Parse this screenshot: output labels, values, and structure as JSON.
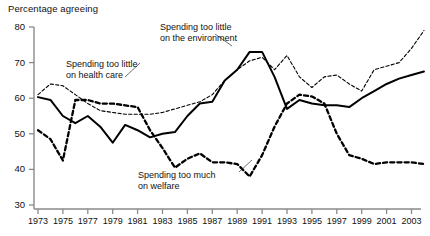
{
  "chart_data": {
    "type": "line",
    "title": "Percentage agreeing",
    "xlabel": "",
    "ylabel": "Percentage agreeing",
    "ylim": [
      30,
      80
    ],
    "xlim": [
      1972,
      2004.5
    ],
    "yticks": [
      30,
      40,
      50,
      60,
      70,
      80
    ],
    "xticks": [
      1973,
      1975,
      1977,
      1979,
      1981,
      1983,
      1985,
      1987,
      1989,
      1991,
      1993,
      1995,
      1997,
      1999,
      2001,
      2003
    ],
    "grid": false,
    "legend_position": "inline-annotations",
    "series": [
      {
        "name": "Spending too little on the environment",
        "style": "solid",
        "color": "#000000",
        "points": [
          [
            1973,
            60.3
          ],
          [
            1974,
            59.5
          ],
          [
            1975,
            55.0
          ],
          [
            1976,
            53.0
          ],
          [
            1977,
            55.0
          ],
          [
            1978,
            52.0
          ],
          [
            1979,
            47.5
          ],
          [
            1980,
            52.5
          ],
          [
            1981,
            51.0
          ],
          [
            1982,
            49.0
          ],
          [
            1983,
            50.0
          ],
          [
            1984,
            50.5
          ],
          [
            1985,
            55.0
          ],
          [
            1986,
            58.5
          ],
          [
            1987,
            59.0
          ],
          [
            1988,
            65.0
          ],
          [
            1989,
            68.0
          ],
          [
            1990,
            73.0
          ],
          [
            1991,
            73.0
          ],
          [
            1992,
            66.0
          ],
          [
            1993,
            57.0
          ],
          [
            1994,
            59.5
          ],
          [
            1995,
            58.5
          ],
          [
            1996,
            58.0
          ],
          [
            1997,
            58.0
          ],
          [
            1998,
            57.5
          ],
          [
            1999,
            60.0
          ],
          [
            2000,
            62.0
          ],
          [
            2001,
            64.0
          ],
          [
            2002,
            65.5
          ],
          [
            2003,
            66.5
          ],
          [
            2004,
            67.5
          ]
        ]
      },
      {
        "name": "Spending too little on health care",
        "style": "fine-dashed",
        "color": "#000000",
        "points": [
          [
            1973,
            61.0
          ],
          [
            1974,
            64.0
          ],
          [
            1975,
            63.5
          ],
          [
            1976,
            61.0
          ],
          [
            1977,
            58.5
          ],
          [
            1978,
            56.5
          ],
          [
            1979,
            56.0
          ],
          [
            1980,
            55.5
          ],
          [
            1981,
            55.5
          ],
          [
            1982,
            55.5
          ],
          [
            1983,
            56.0
          ],
          [
            1984,
            57.0
          ],
          [
            1985,
            58.0
          ],
          [
            1986,
            59.0
          ],
          [
            1987,
            61.0
          ],
          [
            1988,
            65.0
          ],
          [
            1989,
            68.0
          ],
          [
            1990,
            70.5
          ],
          [
            1991,
            71.5
          ],
          [
            1992,
            68.0
          ],
          [
            1993,
            72.0
          ],
          [
            1994,
            66.0
          ],
          [
            1995,
            63.0
          ],
          [
            1996,
            66.0
          ],
          [
            1997,
            66.5
          ],
          [
            1998,
            64.0
          ],
          [
            1999,
            62.0
          ],
          [
            2000,
            68.0
          ],
          [
            2001,
            69.0
          ],
          [
            2002,
            70.0
          ],
          [
            2003,
            74.0
          ],
          [
            2004,
            79.0
          ]
        ]
      },
      {
        "name": "Spending too much on welfare",
        "style": "bold-dashed",
        "color": "#000000",
        "points": [
          [
            1973,
            51.0
          ],
          [
            1974,
            48.5
          ],
          [
            1975,
            42.5
          ],
          [
            1976,
            59.5
          ],
          [
            1977,
            59.5
          ],
          [
            1978,
            58.5
          ],
          [
            1979,
            58.5
          ],
          [
            1980,
            58.0
          ],
          [
            1981,
            57.5
          ],
          [
            1982,
            51.0
          ],
          [
            1983,
            46.0
          ],
          [
            1984,
            40.5
          ],
          [
            1985,
            43.0
          ],
          [
            1986,
            44.5
          ],
          [
            1987,
            42.0
          ],
          [
            1988,
            42.0
          ],
          [
            1989,
            41.5
          ],
          [
            1990,
            38.0
          ],
          [
            1991,
            44.0
          ],
          [
            1992,
            52.0
          ],
          [
            1993,
            58.5
          ],
          [
            1994,
            61.0
          ],
          [
            1995,
            60.5
          ],
          [
            1996,
            58.5
          ],
          [
            1997,
            50.0
          ],
          [
            1998,
            44.0
          ],
          [
            1999,
            43.0
          ],
          [
            2000,
            41.5
          ],
          [
            2001,
            42.0
          ],
          [
            2002,
            42.0
          ],
          [
            2003,
            42.0
          ],
          [
            2004,
            41.5
          ]
        ]
      }
    ],
    "annotations": [
      {
        "id": "env",
        "lines": [
          "Spending too little",
          "on the environment"
        ],
        "x": 160,
        "y": 22
      },
      {
        "id": "health",
        "lines": [
          "Spending too little",
          "on health care"
        ],
        "x": 66,
        "y": 59
      },
      {
        "id": "welfare",
        "lines": [
          "Spending too much",
          "on welfare"
        ],
        "x": 138,
        "y": 170
      }
    ]
  }
}
